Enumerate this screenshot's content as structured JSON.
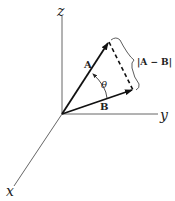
{
  "diagram": {
    "title": "",
    "axes": {
      "x": {
        "label": "x"
      },
      "y": {
        "label": "y"
      },
      "z": {
        "label": "z"
      }
    },
    "vectors": [
      {
        "name": "A",
        "label": "A"
      },
      {
        "name": "B",
        "label": "B"
      }
    ],
    "angle": {
      "label": "θ"
    },
    "difference": {
      "label": "|A − B|"
    },
    "colors": {
      "axis": "#555555",
      "vector": "#111111",
      "dashed": "#111111",
      "background": "#ffffff"
    }
  }
}
